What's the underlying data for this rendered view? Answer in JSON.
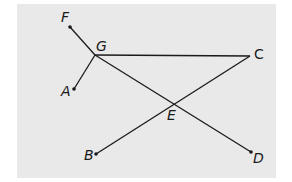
{
  "diagram": {
    "background_color": "#e9e9e9",
    "line_color": "#1a1a1a",
    "points": {
      "F": {
        "label": "F",
        "x": 70,
        "y": 27
      },
      "G": {
        "label": "G",
        "x": 95,
        "y": 55
      },
      "A": {
        "label": "A",
        "x": 74,
        "y": 89
      },
      "C": {
        "label": "C",
        "x": 250,
        "y": 56
      },
      "E": {
        "label": "E",
        "x": 172,
        "y": 103
      },
      "B": {
        "label": "B",
        "x": 96,
        "y": 154
      },
      "D": {
        "label": "D",
        "x": 251,
        "y": 152
      }
    },
    "segments": [
      {
        "from": "F",
        "to": "G"
      },
      {
        "from": "G",
        "to": "A"
      },
      {
        "from": "G",
        "to": "C"
      },
      {
        "from": "G",
        "to": "D"
      },
      {
        "from": "C",
        "to": "B"
      }
    ],
    "intersection": {
      "point": "E",
      "of": [
        "GD",
        "CB"
      ]
    }
  }
}
